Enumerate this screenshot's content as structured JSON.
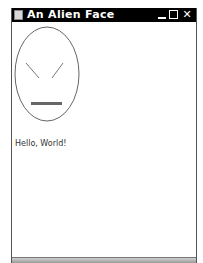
{
  "window": {
    "title": "An Alien Face",
    "controls": {
      "minimize_icon": "minimize-icon",
      "maximize_icon": "maximize-icon",
      "close_icon": "close-icon",
      "close_glyph": "✕"
    }
  },
  "canvas": {
    "face": {
      "stroke_color": "#666666",
      "mouth_color": "#666666"
    },
    "greeting": "Hello, World!"
  }
}
